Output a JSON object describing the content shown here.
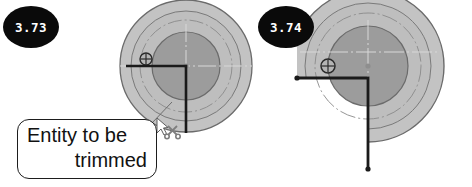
{
  "page": {
    "background_color": "#ffffff",
    "width": 472,
    "height": 187
  },
  "palette": {
    "outer_ring_fill": "#c3c3c3",
    "mid_ring_fill": "#bdbdbd",
    "inner_disc_fill": "#9c9c9c",
    "outline": "#6b6b6b",
    "centerline": "#8a8a8a",
    "geometry_line": "#1a1a1a",
    "badge_fill": "#0a0a0a",
    "badge_text": "#ffffff",
    "callout_border": "#1d1d1d",
    "callout_fill": "#ffffff",
    "leader_line": "#6e6e6e",
    "cursor_gray": "#8d8d8d"
  },
  "steps": [
    {
      "number": "3.73",
      "side": "left",
      "caption_line_1": "Entity to be",
      "caption_line_2": "trimmed",
      "cursor": "trim-scissors-cursor",
      "state": "before-trim"
    },
    {
      "number": "3.74",
      "side": "right",
      "state": "after-trim"
    }
  ],
  "left_figure": {
    "name": "cad-part-before-trim",
    "center": {
      "x": 186,
      "y": 66
    },
    "outer_radius": 66,
    "mid_radius": 55,
    "bolt_circle_radius": 46,
    "inner_radius": 34,
    "hub_radius": 3,
    "grip_marker": {
      "x": 146,
      "y": 59,
      "radius": 6,
      "type": "snap-node-marker"
    },
    "polyline": {
      "type": "L-shaped-geometry",
      "horizontal_from": {
        "x": 126,
        "y": 66
      },
      "corner": {
        "x": 186,
        "y": 66
      },
      "vertical_to": {
        "x": 186,
        "y": 133
      }
    }
  },
  "right_figure": {
    "name": "cad-part-after-trim",
    "center": {
      "x": 368,
      "y": 66
    },
    "outer_radius": 76,
    "mid_radius": 63,
    "bolt_circle_radius": 53,
    "inner_radius": 40,
    "hub_radius": 3,
    "grip_marker": {
      "x": 328,
      "y": 66,
      "radius": 7,
      "type": "snap-node-marker"
    },
    "polyline": {
      "type": "L-shaped-geometry",
      "horizontal_from": {
        "x": 297,
        "y": 78
      },
      "corner": {
        "x": 368,
        "y": 78
      },
      "vertical_to": {
        "x": 368,
        "y": 169
      }
    },
    "trimmed_quadrant": "lower-left"
  },
  "callout": {
    "name": "annotation-balloon",
    "text_line_1": "Entity to be",
    "text_line_2": "trimmed",
    "leader_from": {
      "x": 152,
      "y": 123
    },
    "leader_to": {
      "x": 171,
      "y": 103
    }
  },
  "cursor": {
    "name": "trim-scissors-cursor",
    "x": 158,
    "y": 122,
    "tool": "scissors"
  }
}
